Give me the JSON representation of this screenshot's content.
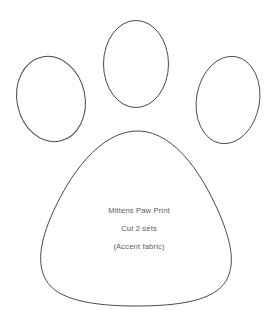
{
  "document": {
    "title": "Mittens Paw Print Pattern Template",
    "background_color": "#ffffff",
    "outline_color": "#4a4a4f",
    "text_color": "#5b5b5f",
    "width": 274,
    "height": 326
  },
  "shapes": {
    "toe_left": {
      "name": "Left toe pad",
      "center_x": 51,
      "center_y": 99,
      "radius_x": 34,
      "radius_y": 43,
      "rotation": -12
    },
    "toe_middle": {
      "name": "Middle toe pad",
      "center_x": 136,
      "center_y": 64,
      "radius_x": 32.5,
      "radius_y": 43.5,
      "rotation": 0
    },
    "toe_right": {
      "name": "Right toe pad",
      "center_x": 228,
      "center_y": 100,
      "radius_x": 31.5,
      "radius_y": 44,
      "rotation": 10
    },
    "main_pad": {
      "name": "Main paw pad",
      "apex_x": 139,
      "apex_y": 131,
      "left_x": 40,
      "right_x": 234,
      "bottom_y": 305,
      "path": "M 139 131 C 176 132 205 178 222 220 C 232 246 235 265 226 281 C 214 301 178 306 136 306 C 93 306 57 300 46 280 C 37 264 40 244 50 219 C 68 176 100 130 139 131 Z"
    }
  },
  "labels": {
    "line1": "Mittens Paw Print",
    "line2": "Cut 2 sets",
    "line3": "(Accent fabric)",
    "line1_x": 139,
    "line1_y": 211,
    "line2_x": 139,
    "line2_y": 229,
    "line3_x": 139,
    "line3_y": 247
  }
}
